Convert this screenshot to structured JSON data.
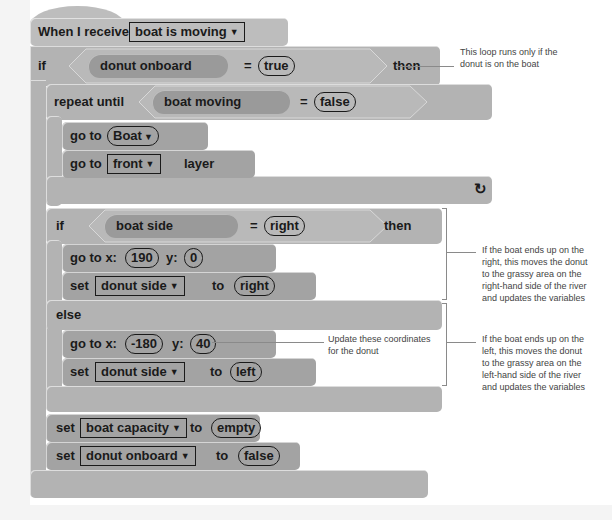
{
  "hat": {
    "label": "When I receive",
    "message": "boat is moving",
    "dropdown_icon": "▼"
  },
  "if_outer": {
    "label": "if",
    "variable": "donut onboard",
    "operator": "=",
    "value": "true",
    "then": "then"
  },
  "repeat_until": {
    "label": "repeat until",
    "variable": "boat moving",
    "operator": "=",
    "value": "false",
    "loop_icon": "↻"
  },
  "go_to_sprite": {
    "label": "go to",
    "target": "Boat",
    "dropdown_icon": "▼"
  },
  "go_to_layer": {
    "label": "go to",
    "layer": "front",
    "suffix": "layer",
    "dropdown_icon": "▼"
  },
  "if_inner": {
    "label": "if",
    "variable": "boat side",
    "operator": "=",
    "value": "right",
    "then": "then",
    "else": "else"
  },
  "goto_xy_right": {
    "label": "go to x:",
    "x": "190",
    "y_label": "y:",
    "y": "0"
  },
  "set_side_right": {
    "label": "set",
    "variable": "donut side",
    "to": "to",
    "value": "right",
    "dropdown_icon": "▼"
  },
  "goto_xy_left": {
    "label": "go to x:",
    "x": "-180",
    "y_label": "y:",
    "y": "40"
  },
  "set_side_left": {
    "label": "set",
    "variable": "donut side",
    "to": "to",
    "value": "left",
    "dropdown_icon": "▼"
  },
  "set_capacity": {
    "label": "set",
    "variable": "boat capacity",
    "to": "to",
    "value": "empty",
    "dropdown_icon": "▼"
  },
  "set_onboard": {
    "label": "set",
    "variable": "donut onboard",
    "to": "to",
    "value": "false",
    "dropdown_icon": "▼"
  },
  "annotations": {
    "loop_note": [
      "This loop runs only if the",
      "donut is on the boat"
    ],
    "right_note": [
      "If the boat ends up on the",
      "right, this moves the donut",
      "to the grassy area on the",
      "right-hand side of the river",
      "and updates the variables"
    ],
    "coords_note": [
      "Update these coordinates",
      "for the donut"
    ],
    "left_note": [
      "If the boat ends up on the",
      "left, this moves the donut",
      "to the grassy area on the",
      "left-hand side of the river",
      "and updates the variables"
    ]
  },
  "colors": {
    "block": "#b3b3b3",
    "block_dark": "#a3a3a3",
    "reporter": "#9a9a9a",
    "background": "#ffffff",
    "margin": "#f4f4f4"
  }
}
